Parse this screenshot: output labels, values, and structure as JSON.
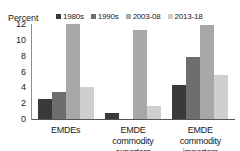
{
  "chart_data": {
    "type": "bar",
    "title": "",
    "subtitle": "",
    "xlabel": "",
    "ylabel": "Percent",
    "ylim": [
      0,
      12
    ],
    "yticks": [
      0,
      2,
      4,
      6,
      8,
      10,
      12
    ],
    "grid": false,
    "legend_position": "top",
    "categories": [
      "EMDEs",
      "EMDE commodity exporters",
      "EMDE commodity importers"
    ],
    "series": [
      {
        "name": "1980s",
        "color": "#3a3a3a",
        "values": [
          2.5,
          0.8,
          4.3
        ]
      },
      {
        "name": "1990s",
        "color": "#6e6e6e",
        "values": [
          3.4,
          0.0,
          7.8
        ]
      },
      {
        "name": "2003-08",
        "color": "#a8a8a8",
        "values": [
          12.0,
          11.2,
          11.9
        ]
      },
      {
        "name": "2013-18",
        "color": "#cfcfcf",
        "values": [
          4.0,
          1.6,
          5.5
        ]
      }
    ]
  }
}
